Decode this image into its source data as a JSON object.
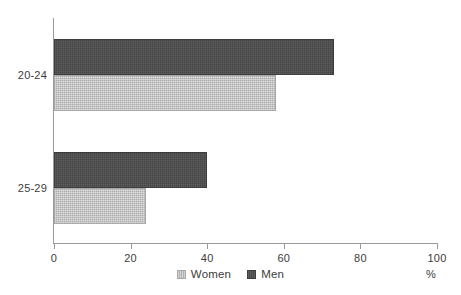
{
  "chart_data": {
    "type": "bar",
    "orientation": "horizontal",
    "title": "",
    "xlabel": "%",
    "ylabel": "",
    "categories": [
      "20-24",
      "25-29"
    ],
    "series": [
      {
        "name": "Women",
        "values": [
          58,
          24
        ],
        "color": "#bcbcbc"
      },
      {
        "name": "Men",
        "values": [
          73,
          40
        ],
        "color": "#4c4c4c"
      }
    ],
    "series_draw_order": [
      "Men",
      "Women"
    ],
    "xlim": [
      0,
      100
    ],
    "xticks": [
      0,
      20,
      40,
      60,
      80,
      100
    ],
    "xtick_labels": [
      "0",
      "20",
      "40",
      "60",
      "80",
      "100"
    ],
    "grid": false,
    "legend_position": "bottom-center",
    "unit_label": "%",
    "background": "#ffffff",
    "axis_color": "#9a9a9a",
    "text_color": "#3c3c3c"
  },
  "legend": {
    "items": [
      {
        "label": "Women",
        "swatch": "women"
      },
      {
        "label": "Men",
        "swatch": "men"
      }
    ]
  },
  "axis": {
    "unit": "%"
  }
}
